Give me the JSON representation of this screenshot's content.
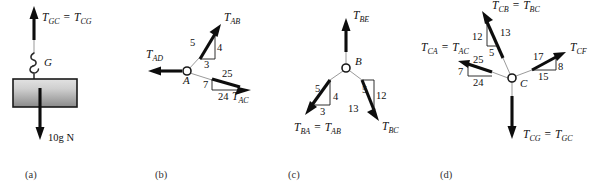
{
  "figure": {
    "background_color": "#ffffff",
    "ink_color": "#0d0d0d",
    "block_fill_top": "#d8d8d8",
    "block_fill_bottom": "#8f8f8f"
  },
  "panels": [
    {
      "id": "a",
      "caption": "(a)",
      "node_label": "G",
      "description": "Suspended block hanging from hook G",
      "forces": [
        {
          "name": "tension-up",
          "label_main": "T",
          "label_sub": "GC",
          "equals": "=",
          "label_main2": "T",
          "label_sub2": "CG",
          "direction": "up"
        },
        {
          "name": "weight-down",
          "label_main": "10g N",
          "direction": "down"
        }
      ],
      "weight_text": "10g N"
    },
    {
      "id": "b",
      "caption": "(b)",
      "node_label": "A",
      "description": "Joint A with three cable tensions",
      "forces": [
        {
          "name": "T-AB",
          "label_main": "T",
          "label_sub": "AB",
          "direction": "up-right",
          "triangle": {
            "hyp": "5",
            "vert": "4",
            "horiz": "3"
          }
        },
        {
          "name": "T-AD",
          "label_main": "T",
          "label_sub": "AD",
          "direction": "left",
          "triangle": null
        },
        {
          "name": "T-AC",
          "label_main": "T",
          "label_sub": "AC",
          "direction": "right-down",
          "triangle": {
            "hyp": "25",
            "vert": "7",
            "horiz": "24"
          }
        }
      ]
    },
    {
      "id": "c",
      "caption": "(c)",
      "node_label": "B",
      "description": "Joint B with three cable tensions",
      "forces": [
        {
          "name": "T-BE",
          "label_main": "T",
          "label_sub": "BE",
          "direction": "up",
          "triangle": null
        },
        {
          "name": "T-BA",
          "label_main": "T",
          "label_sub": "BA",
          "equals": "=",
          "label_main2": "T",
          "label_sub2": "AB",
          "direction": "down-left",
          "triangle": {
            "hyp": "5",
            "vert": "4",
            "horiz": "3"
          }
        },
        {
          "name": "T-BC",
          "label_main": "T",
          "label_sub": "BC",
          "direction": "down-right",
          "triangle": {
            "hyp": "13",
            "vert": "12",
            "horiz": "5"
          }
        }
      ]
    },
    {
      "id": "d",
      "caption": "(d)",
      "node_label": "C",
      "description": "Joint C with four cable tensions",
      "forces": [
        {
          "name": "T-CB",
          "label_main": "T",
          "label_sub": "CB",
          "equals": "=",
          "label_main2": "T",
          "label_sub2": "BC",
          "direction": "up-right",
          "triangle": {
            "hyp": "13",
            "vert": "12",
            "horiz": "5"
          }
        },
        {
          "name": "T-CA",
          "label_main": "T",
          "label_sub": "CA",
          "equals": "=",
          "label_main2": "T",
          "label_sub2": "AC",
          "direction": "left-up",
          "triangle": {
            "hyp": "25",
            "vert": "7",
            "horiz": "24"
          }
        },
        {
          "name": "T-CF",
          "label_main": "T",
          "label_sub": "CF",
          "direction": "right-up",
          "triangle": {
            "hyp": "17",
            "vert": "8",
            "horiz": "15"
          }
        },
        {
          "name": "T-CG",
          "label_main": "T",
          "label_sub": "CG",
          "equals": "=",
          "label_main2": "T",
          "label_sub2": "GC",
          "direction": "down",
          "triangle": null
        }
      ]
    }
  ],
  "text": {
    "a_T_GC": "T",
    "a_T_GC_sub": "GC",
    "a_eq": "=",
    "a_T_CG": "T",
    "a_T_CG_sub": "CG",
    "a_G": "G",
    "a_weight": "10g N",
    "a_caption": "(a)",
    "b_T_AB": "T",
    "b_T_AB_sub": "AB",
    "b_T_AD": "T",
    "b_T_AD_sub": "AD",
    "b_T_AC": "T",
    "b_T_AC_sub": "AC",
    "b_A": "A",
    "b_n5": "5",
    "b_n4": "4",
    "b_n3": "3",
    "b_n25": "25",
    "b_n7": "7",
    "b_n24": "24",
    "b_caption": "(b)",
    "c_T_BE": "T",
    "c_T_BE_sub": "BE",
    "c_T_BA": "T",
    "c_T_BA_sub": "BA",
    "c_eq": "=",
    "c_T_AB": "T",
    "c_T_AB_sub": "AB",
    "c_T_BC": "T",
    "c_T_BC_sub": "BC",
    "c_B": "B",
    "c_n5L": "5",
    "c_n4": "4",
    "c_n3": "3",
    "c_n5R": "5",
    "c_n12": "12",
    "c_n13": "13",
    "c_caption": "(c)",
    "d_T_CB": "T",
    "d_T_CB_sub": "CB",
    "d_eq1": "=",
    "d_T_BC": "T",
    "d_T_BC_sub": "BC",
    "d_T_CA": "T",
    "d_T_CA_sub": "CA",
    "d_eq2": "=",
    "d_T_AC": "T",
    "d_T_AC_sub": "AC",
    "d_T_CF": "T",
    "d_T_CF_sub": "CF",
    "d_T_CG": "T",
    "d_T_CG_sub": "CG",
    "d_eq3": "=",
    "d_T_GC": "T",
    "d_T_GC_sub": "GC",
    "d_C": "C",
    "d_n12": "12",
    "d_n13": "13",
    "d_n5": "5",
    "d_n25": "25",
    "d_n7": "7",
    "d_n24": "24",
    "d_n17": "17",
    "d_n8": "8",
    "d_n15": "15",
    "d_caption": "(d)"
  }
}
